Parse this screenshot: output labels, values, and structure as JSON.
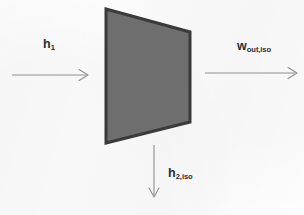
{
  "figure": {
    "background_color": "#fdfdfd",
    "device": {
      "name": "turbine-block",
      "fill_color": "#6e6e6e",
      "stroke_color": "#3a3a3a",
      "stroke_width": 3,
      "points": "106,9 190,32 190,122 106,143"
    },
    "arrows": [
      {
        "name": "inlet-enthalpy-arrow",
        "direction": "right",
        "color": "#8f8f8f",
        "x1": 12,
        "y1": 75,
        "x2": 88,
        "y2": 75
      },
      {
        "name": "work-output-arrow",
        "direction": "right",
        "color": "#8f8f8f",
        "x1": 205,
        "y1": 73,
        "x2": 297,
        "y2": 73
      },
      {
        "name": "outlet-enthalpy-arrow",
        "direction": "down",
        "color": "#8f8f8f",
        "x1": 154,
        "y1": 145,
        "x2": 154,
        "y2": 197
      }
    ],
    "labels": {
      "inlet_enthalpy": {
        "base": "h",
        "sub": "1"
      },
      "work_output": {
        "base": "w",
        "sub": "out,iso"
      },
      "outlet_enthalpy": {
        "base": "h",
        "sub": "2,iso"
      }
    }
  }
}
